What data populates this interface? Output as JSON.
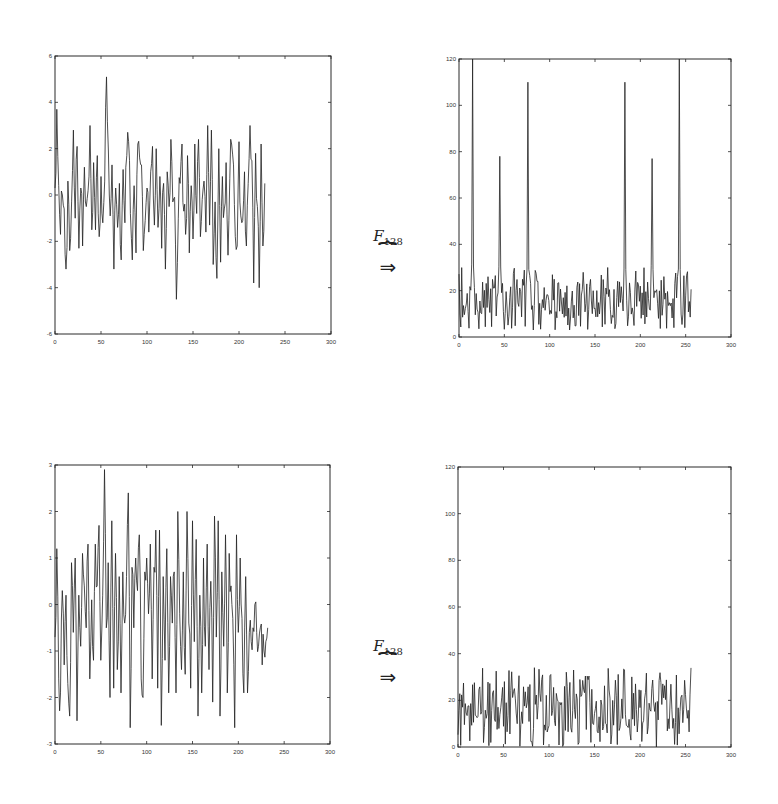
{
  "figure": {
    "arrows": [
      {
        "operator": "F",
        "subscript": "128",
        "symbol": "⇒",
        "brace": "⏞"
      },
      {
        "operator": "F",
        "subscript": "128",
        "symbol": "⇒",
        "brace": "⏞"
      }
    ]
  },
  "chart_data": [
    {
      "id": "top-left",
      "type": "line",
      "title": "",
      "xlabel": "",
      "ylabel": "",
      "xlim": [
        0,
        300
      ],
      "ylim": [
        -6,
        6
      ],
      "xticks": [
        0,
        50,
        100,
        150,
        200,
        250,
        300
      ],
      "yticks": [
        -6,
        -4,
        -2,
        0,
        2,
        4,
        6
      ],
      "xtick_labels": [
        "0",
        "50",
        "100",
        "150",
        "200",
        "250",
        "300"
      ],
      "ytick_labels": [
        "-6",
        "-4",
        "-2",
        "0",
        "2",
        "4",
        "6"
      ],
      "grid": false,
      "description": "Noisy signal of 256 samples, mostly within [-3, 3]; peak ~5.1 near x=57, minimum ~-4.5 near x=140",
      "x": [
        0,
        2,
        4,
        6,
        8,
        10,
        12,
        14,
        16,
        18,
        20,
        22,
        24,
        26,
        28,
        30,
        32,
        34,
        36,
        38,
        40,
        42,
        44,
        46,
        48,
        50,
        52,
        54,
        56,
        58,
        60,
        62,
        64,
        66,
        68,
        70,
        72,
        74,
        76,
        78,
        80,
        82,
        84,
        86,
        88,
        90,
        92,
        94,
        96,
        98,
        100,
        102,
        104,
        106,
        108,
        110,
        112,
        114,
        116,
        118,
        120,
        122,
        124,
        126,
        128,
        130,
        132,
        134,
        136,
        138,
        140,
        142,
        144,
        146,
        148,
        150,
        152,
        154,
        156,
        158,
        160,
        162,
        164,
        166,
        168,
        170,
        172,
        174,
        176,
        178,
        180,
        182,
        184,
        186,
        188,
        190,
        192,
        194,
        196,
        198,
        200,
        202,
        204,
        206,
        208,
        210,
        212,
        214,
        216,
        218,
        220,
        222,
        224,
        226,
        228,
        230,
        232,
        234,
        236,
        238,
        240,
        242,
        244,
        246,
        248,
        250,
        252,
        254,
        256
      ],
      "y": [
        0.3,
        3.7,
        0.4,
        -1.7,
        0,
        -0.6,
        -3.2,
        0.6,
        -2.4,
        -0.3,
        2.8,
        -1,
        2.1,
        -2.3,
        0.3,
        -2.2,
        1.2,
        -0.5,
        0.2,
        3,
        -1.5,
        1.4,
        -1.5,
        1.7,
        -1.8,
        0.8,
        -1.2,
        0.6,
        5.1,
        1.9,
        -0.9,
        1.3,
        -3.2,
        0.3,
        -1.4,
        0.5,
        -2.8,
        1.1,
        -1.2,
        1.7,
        2.3,
        -0.8,
        -2.8,
        0.4,
        -2.5,
        2.2,
        1.6,
        1.3,
        -2.4,
        -1.1,
        0.3,
        -1.6,
        1.0,
        2.1,
        -1.3,
        2.0,
        -1.4,
        0.8,
        -2.3,
        0.5,
        -3.2,
        1.0,
        -0.5,
        2.4,
        -0.3,
        -0.1,
        -4.5,
        -1.0,
        0.5,
        2.2,
        -0.7,
        -1.7,
        1.7,
        -2.5,
        0.4,
        -1.9,
        2.2,
        -0.8,
        2.4,
        -1.8,
        -0.2,
        0.6,
        -1.6,
        3.0,
        -1.3,
        2.8,
        -3.0,
        -0.3,
        -3.6,
        2.0,
        -2.9,
        0.8,
        -0.6,
        1.4,
        -2.6,
        0.7,
        2.2,
        1.3,
        -1.8,
        -2.2,
        2.3,
        -0.9,
        -1.1,
        1.0,
        -2.2,
        0.5,
        3.0,
        1.5,
        -3.8,
        1.8,
        -0.5,
        -4.0,
        2.2,
        -2.2,
        0.5
      ]
    },
    {
      "id": "top-right",
      "type": "line",
      "title": "",
      "xlabel": "",
      "ylabel": "",
      "xlim": [
        0,
        300
      ],
      "ylim": [
        0,
        120
      ],
      "xticks": [
        0,
        50,
        100,
        150,
        200,
        250,
        300
      ],
      "yticks": [
        0,
        20,
        40,
        60,
        80,
        100,
        120
      ],
      "xtick_labels": [
        "0",
        "50",
        "100",
        "150",
        "200",
        "250",
        "300"
      ],
      "ytick_labels": [
        "0",
        "20",
        "40",
        "60",
        "80",
        "100",
        "120"
      ],
      "grid": false,
      "description": "Magnitude after F128 transform: noise floor ~5-30 with six sharp spikes",
      "peaks": [
        {
          "x": 15,
          "y": 120
        },
        {
          "x": 45,
          "y": 78
        },
        {
          "x": 76,
          "y": 110
        },
        {
          "x": 183,
          "y": 110
        },
        {
          "x": 213,
          "y": 77
        },
        {
          "x": 243,
          "y": 120
        }
      ],
      "noise_floor_range": [
        3,
        30
      ]
    },
    {
      "id": "bottom-left",
      "type": "line",
      "title": "",
      "xlabel": "",
      "ylabel": "",
      "xlim": [
        0,
        300
      ],
      "ylim": [
        -3,
        3
      ],
      "xticks": [
        0,
        50,
        100,
        150,
        200,
        250,
        300
      ],
      "yticks": [
        -3,
        -2,
        -1,
        0,
        1,
        2,
        3
      ],
      "xtick_labels": [
        "0",
        "50",
        "100",
        "150",
        "200",
        "250",
        "300"
      ],
      "ytick_labels": [
        "-3",
        "-2",
        "-1",
        "0",
        "1",
        "2",
        "3"
      ],
      "grid": false,
      "description": "Noisy signal of 256 samples mostly within [-2.5, 2]; peak ~2.9 near x=56, minimum ~-2.65 near x=84 and x=244",
      "x": [
        0,
        2,
        4,
        6,
        8,
        10,
        12,
        14,
        16,
        18,
        20,
        22,
        24,
        26,
        28,
        30,
        32,
        34,
        36,
        38,
        40,
        42,
        44,
        46,
        48,
        50,
        52,
        54,
        56,
        58,
        60,
        62,
        64,
        66,
        68,
        70,
        72,
        74,
        76,
        78,
        80,
        82,
        84,
        86,
        88,
        90,
        92,
        94,
        96,
        98,
        100,
        102,
        104,
        106,
        108,
        110,
        112,
        114,
        116,
        118,
        120,
        122,
        124,
        126,
        128,
        130,
        132,
        134,
        136,
        138,
        140,
        142,
        144,
        146,
        148,
        150,
        152,
        154,
        156,
        158,
        160,
        162,
        164,
        166,
        168,
        170,
        172,
        174,
        176,
        178,
        180,
        182,
        184,
        186,
        188,
        190,
        192,
        194,
        196,
        198,
        200,
        202,
        204,
        206,
        208,
        210,
        212,
        214,
        216,
        218,
        220,
        222,
        224,
        226,
        228,
        230,
        232,
        234,
        236,
        238,
        240,
        242,
        244,
        246,
        248,
        250,
        252,
        254,
        256
      ],
      "y": [
        -0.7,
        1.2,
        -1.6,
        -1.9,
        0.3,
        -1.3,
        0.2,
        -1.7,
        -2.4,
        0.9,
        -0.6,
        1.0,
        -2.5,
        0.2,
        -0.9,
        1.1,
        0.4,
        -0.5,
        1.3,
        -1.6,
        0.1,
        -1.2,
        1.3,
        0.4,
        1.7,
        -1.2,
        0.2,
        2.9,
        -0.5,
        0.9,
        -2.0,
        1.8,
        -1.8,
        1.1,
        -1.4,
        0.6,
        -1.9,
        0.7,
        -0.4,
        0.6,
        2.4,
        -2.65,
        0.8,
        -0.5,
        1.0,
        0.3,
        1.5,
        -1.6,
        -2.0,
        0.7,
        1.0,
        -0.2,
        1.3,
        -1.6,
        0.8,
        1.6,
        -1.8,
        1.6,
        -2.6,
        0.6,
        -1.2,
        1.2,
        -1.9,
        0.6,
        -0.4,
        0.7,
        -1.9,
        2.0,
        -0.2,
        -1.4,
        0.7,
        -1.5,
        2.0,
        -0.4,
        -1.8,
        1.8,
        -0.8,
        1.4,
        -2.4,
        0.2,
        -1.9,
        1.0,
        -0.9,
        1.3,
        -1.4,
        0.5,
        -2.1,
        1.9,
        -0.7,
        1.8,
        -2.4,
        0.7,
        -0.9,
        1.5,
        -1.9,
        1.1,
        0.4,
        -0.3,
        -2.65,
        1.5,
        -0.6,
        1.0,
        -0.3,
        -1.9,
        0.6,
        -1.9,
        -0.6,
        -0.8,
        -0.5,
        0.0,
        -0.6,
        -0.9,
        -0.5,
        -1.3,
        -1.0,
        -0.8,
        -0.5
      ]
    },
    {
      "id": "bottom-right",
      "type": "line",
      "title": "",
      "xlabel": "",
      "ylabel": "",
      "xlim": [
        0,
        300
      ],
      "ylim": [
        0,
        120
      ],
      "xticks": [
        0,
        50,
        100,
        150,
        200,
        250,
        300
      ],
      "yticks": [
        0,
        20,
        40,
        60,
        80,
        100,
        120
      ],
      "xtick_labels": [
        "0",
        "50",
        "100",
        "150",
        "200",
        "250",
        "300"
      ],
      "ytick_labels": [
        "0",
        "20",
        "40",
        "60",
        "80",
        "100",
        "120"
      ],
      "grid": false,
      "description": "Magnitude after F128 transform: no dominant peaks, values ~0-34 across all 256 samples",
      "max_value": 34,
      "noise_floor_range": [
        0,
        34
      ]
    }
  ]
}
